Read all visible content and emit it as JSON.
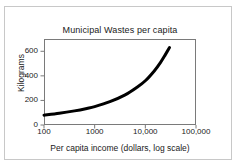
{
  "chart_data": {
    "type": "line",
    "title": "Municipal Wastes per capita",
    "xlabel": "Per capita income (dollars, log scale)",
    "ylabel": "Kilograms",
    "xscale": "log",
    "yscale": "linear",
    "xlim": [
      100,
      100000
    ],
    "ylim": [
      0,
      700
    ],
    "xticks": [
      100,
      1000,
      10000,
      100000
    ],
    "xtick_labels": [
      "100",
      "1000",
      "10,000",
      "100,000"
    ],
    "yticks": [
      0,
      200,
      400,
      600
    ],
    "ytick_labels": [
      "0",
      "200",
      "400",
      "600"
    ],
    "grid": false,
    "legend": null,
    "series": [
      {
        "name": "Municipal waste per capita",
        "color": "#000000",
        "linewidth": 3,
        "x": [
          100,
          200,
          400,
          700,
          1000,
          2000,
          4000,
          7000,
          10000,
          15000,
          20000,
          25000,
          30000
        ],
        "y": [
          80,
          95,
          115,
          135,
          150,
          190,
          245,
          310,
          360,
          440,
          510,
          575,
          630
        ]
      }
    ]
  },
  "figure": {
    "background_color": "#ffffff",
    "outer_border_color": "#c8c8c8",
    "axis_color": "#7a7a7a",
    "text_color": "#1a1a1a"
  }
}
